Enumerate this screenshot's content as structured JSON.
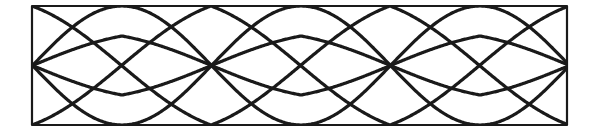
{
  "pattern": {
    "label": "Decorative interlaced lens and diamond border pattern",
    "stroke_color": "#1a1a1a",
    "background": "#ffffff",
    "frame": {
      "x": 32,
      "y": 6,
      "width": 535,
      "height": 119,
      "stroke_width": 2.2
    },
    "line_width": 3.2,
    "mid_y": 65.5,
    "lens_centers": [
      122,
      302,
      480
    ],
    "waves": [
      {
        "name": "outer-lens-upper",
        "amplitude": 59.5,
        "half_period": 179,
        "peak_x": 122,
        "phase": "top"
      },
      {
        "name": "outer-lens-lower",
        "amplitude": 59.5,
        "half_period": 179,
        "peak_x": 122,
        "phase": "bottom"
      },
      {
        "name": "diamond-upper",
        "amplitude": 29.5,
        "half_period": 179,
        "peak_x": 122,
        "phase": "top",
        "shape": "triangle"
      },
      {
        "name": "diamond-lower",
        "amplitude": 29.5,
        "half_period": 179,
        "peak_x": 122,
        "phase": "bottom",
        "shape": "triangle"
      }
    ],
    "lattice": [
      {
        "name": "lattice-a",
        "amplitude": 59.5,
        "half_period": 179,
        "peak_x": 32,
        "phase": "top",
        "shape": "triangle"
      },
      {
        "name": "lattice-b",
        "amplitude": 59.5,
        "half_period": 179,
        "peak_x": 32,
        "phase": "bottom",
        "shape": "triangle"
      }
    ]
  }
}
